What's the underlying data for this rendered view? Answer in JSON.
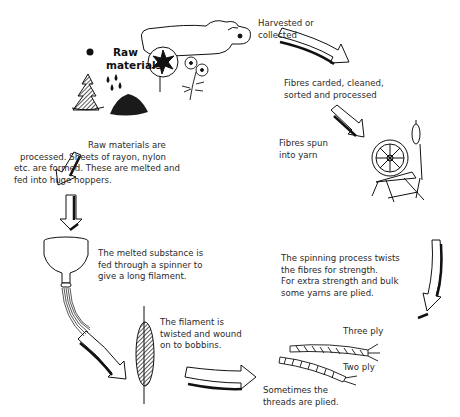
{
  "diagram": {
    "type": "process-cycle",
    "colors": {
      "ink": "#111111",
      "text": "#2a2a2a",
      "background": "#ffffff"
    }
  },
  "labels": {
    "raw_materials": [
      "Raw",
      "materials"
    ],
    "harvested": [
      "Harvested or",
      "collected"
    ],
    "carded": [
      "Fibres carded, cleaned,",
      "sorted and processed"
    ],
    "spun": [
      "Fibres spun",
      "into yarn"
    ],
    "spinning_process": [
      "The spinning process twists",
      "the fibres for strength.",
      "For extra strength and bulk",
      "some yarns are plied."
    ],
    "three_ply": "Three ply",
    "two_ply": "Two ply",
    "plied": [
      "Sometimes the",
      "threads are plied."
    ],
    "filament_wound": [
      "The filament is",
      "twisted and wound",
      "on to bobbins."
    ],
    "melted_substance": [
      "The melted substance is",
      "fed through a spinner to",
      "give a long filament."
    ],
    "raw_processed": [
      "Raw materials are",
      "processed. Sheets of rayon, nylon",
      "etc. are formed. These are melted and",
      "fed into huge hoppers."
    ]
  },
  "illustrations": [
    "sheep-icon",
    "cotton-plant-icon",
    "flax-flower-icon",
    "tree-icon",
    "oil-drops-icon",
    "coal-pile-icon",
    "spinning-wheel-icon",
    "hopper-icon",
    "bobbin-icon",
    "three-ply-yarn-icon",
    "two-ply-yarn-icon"
  ]
}
